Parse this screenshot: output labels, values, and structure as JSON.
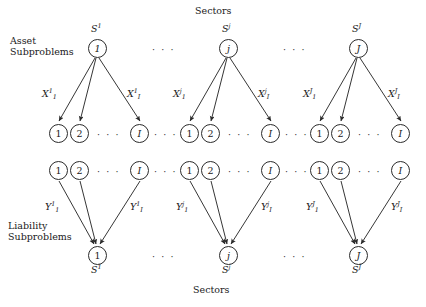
{
  "figure": {
    "top_title": "Sectors",
    "bottom_title": "Sectors",
    "left_label_top_line1": "Asset",
    "left_label_top_line2": "Subproblems",
    "left_label_bottom_line1": "Liability",
    "left_label_bottom_line2": "Subproblems",
    "ellipsis": "· · ·",
    "ink_color": "#2b2b2b",
    "background_color": "#ffffff"
  },
  "groups": [
    {
      "id": "group-1",
      "sector_index": "1",
      "asset_node_label": "1",
      "asset_tag_base": "S",
      "asset_tag_sup": "1",
      "liability_node_label": "1",
      "liability_tag_base": "S",
      "liability_tag_sup": "1",
      "x_first_base": "X",
      "x_first_sub": "1",
      "x_first_sup": "1",
      "x_last_base": "X",
      "x_last_sub": "I",
      "x_last_sup": "1",
      "y_first_base": "Y",
      "y_first_sub": "1",
      "y_first_sup": "1",
      "y_last_base": "Y",
      "y_last_sub": "I",
      "y_last_sup": "1",
      "asset_children": [
        "1",
        "2",
        "I"
      ],
      "liability_children": [
        "1",
        "2",
        "I"
      ]
    },
    {
      "id": "group-j",
      "sector_index": "j",
      "asset_node_label": "j",
      "asset_tag_base": "S",
      "asset_tag_sup": "j",
      "liability_node_label": "j",
      "liability_tag_base": "S",
      "liability_tag_sup": "j",
      "x_first_base": "X",
      "x_first_sub": "1",
      "x_first_sup": "j",
      "x_last_base": "X",
      "x_last_sub": "I",
      "x_last_sup": "j",
      "y_first_base": "Y",
      "y_first_sub": "1",
      "y_first_sup": "j",
      "y_last_base": "Y",
      "y_last_sub": "I",
      "y_last_sup": "j",
      "asset_children": [
        "1",
        "2",
        "I"
      ],
      "liability_children": [
        "1",
        "2",
        "I"
      ]
    },
    {
      "id": "group-J",
      "sector_index": "J",
      "asset_node_label": "J",
      "asset_tag_base": "S",
      "asset_tag_sup": "J",
      "liability_node_label": "J",
      "liability_tag_base": "S",
      "liability_tag_sup": "J",
      "x_first_base": "X",
      "x_first_sub": "1",
      "x_first_sup": "J",
      "x_last_base": "X",
      "x_last_sub": "I",
      "x_last_sup": "J",
      "y_first_base": "Y",
      "y_first_sub": "1",
      "y_first_sup": "J",
      "y_last_base": "Y",
      "y_last_sub": "I",
      "y_last_sup": "J",
      "asset_children": [
        "1",
        "2",
        "I"
      ],
      "liability_children": [
        "1",
        "2",
        "I"
      ]
    }
  ]
}
